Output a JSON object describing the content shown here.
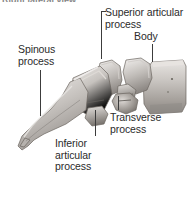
{
  "figure": {
    "title_partial": "Right lateral view",
    "background_color": "#ffffff",
    "ink_color": "#3c3c3c",
    "bone_light": "#f2f0ee",
    "bone_mid": "#bdb9b5",
    "bone_dark": "#7d7975"
  },
  "labels": {
    "spinous_process": "Spinous\nprocess",
    "superior_articular_process": "Superior articular\nprocess",
    "body": "Body",
    "transverse_process": "Transverse\nprocess",
    "inferior_articular_process": "Inferior\narticular\nprocess"
  }
}
